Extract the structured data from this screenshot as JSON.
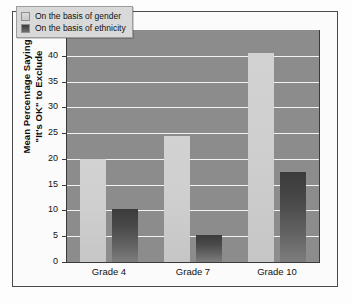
{
  "chart_data": {
    "type": "bar",
    "title": "",
    "subtitle": "",
    "xlabel": "",
    "ylabel_line1": "Mean Percentage Saying",
    "ylabel_line2": "\"It's OK\" to Exclude",
    "categories": [
      "Grade 4",
      "Grade 7",
      "Grade 10"
    ],
    "series": [
      {
        "name": "On the basis of gender",
        "values": [
          20.0,
          24.5,
          40.5
        ],
        "color": "#cfcfcf"
      },
      {
        "name": "On the basis of ethnicity",
        "values": [
          10.3,
          5.3,
          17.5
        ],
        "color": "#4a4a4a"
      }
    ],
    "ylim": [
      0,
      45
    ],
    "ytick_labels": [
      "45",
      "40",
      "35",
      "30",
      "25",
      "20",
      "15",
      "10",
      "5",
      "0"
    ],
    "ytick_values": [
      45,
      40,
      35,
      30,
      25,
      20,
      15,
      10,
      5,
      0
    ],
    "ytick_step": 5,
    "grid": true,
    "grid_color": "#f2f2f2",
    "legend_position": "upper-left-inside",
    "plot_background": "#8c8c8c",
    "figure_background": "#fbfbfb",
    "border_color": "#4a4a4a"
  },
  "legend": {
    "items": [
      {
        "label": "On the basis of gender",
        "swatch": "gender"
      },
      {
        "label": "On the basis of ethnicity",
        "swatch": "ethnicity"
      }
    ]
  }
}
